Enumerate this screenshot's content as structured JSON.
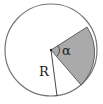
{
  "diagram": {
    "circle": {
      "cx": 51,
      "cy": 50,
      "r": 46,
      "stroke": "#777777",
      "fill": "#ffffff"
    },
    "sector": {
      "start_point": [
        87,
        27
      ],
      "end_point": [
        81,
        82
      ],
      "fill": "#aaaaaa",
      "stroke": "#444444"
    },
    "radius_line": {
      "to": [
        57,
        96
      ]
    },
    "labels": {
      "angle": "α",
      "radius": "R"
    }
  }
}
